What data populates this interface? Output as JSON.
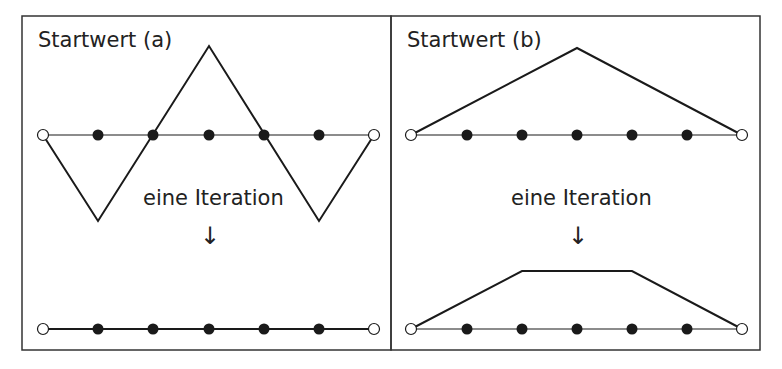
{
  "panels": [
    {
      "title": "Startwert (a)",
      "caption": "eine Iteration",
      "arrow": "↓",
      "initial_shape": "zigzag: down, up, peak, down, up",
      "result_shape": "flat line on axis"
    },
    {
      "title": "Startwert (b)",
      "caption": "eine Iteration",
      "arrow": "↓",
      "initial_shape": "single triangle peak",
      "result_shape": "trapezoid"
    }
  ],
  "grid": {
    "interior_points": 5,
    "boundary_points": 2
  },
  "colors": {
    "line": "#1a1a1a",
    "filled_node": "#1a1a1a",
    "open_node": "#ffffff",
    "border": "#333333"
  }
}
